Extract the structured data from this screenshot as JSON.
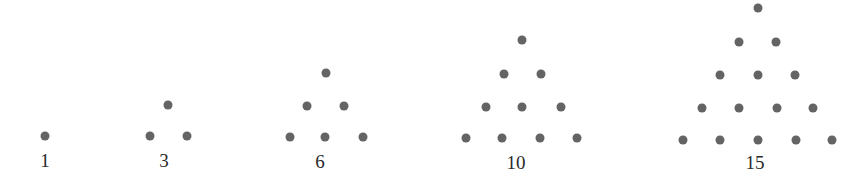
{
  "colors": {
    "dot": "#646464",
    "label": "#2a2a2a",
    "background": "#ffffff"
  },
  "figures": [
    {
      "label": "1",
      "label_pos": [
        45,
        160
      ],
      "dots": [
        [
          45,
          136
        ]
      ]
    },
    {
      "label": "3",
      "label_pos": [
        164,
        160
      ],
      "dots": [
        [
          168,
          105
        ],
        [
          150,
          136
        ],
        [
          187,
          136
        ]
      ]
    },
    {
      "label": "6",
      "label_pos": [
        320,
        161
      ],
      "dots": [
        [
          326,
          73
        ],
        [
          307,
          106
        ],
        [
          344,
          106
        ],
        [
          290,
          137
        ],
        [
          325,
          137
        ],
        [
          363,
          137
        ]
      ]
    },
    {
      "label": "10",
      "label_pos": [
        516,
        162
      ],
      "dots": [
        [
          522,
          40
        ],
        [
          504,
          74
        ],
        [
          541,
          74
        ],
        [
          486,
          107
        ],
        [
          522,
          107
        ],
        [
          561,
          107
        ],
        [
          466,
          138
        ],
        [
          502,
          138
        ],
        [
          540,
          138
        ],
        [
          577,
          138
        ]
      ]
    },
    {
      "label": "15",
      "label_pos": [
        755,
        162
      ],
      "dots": [
        [
          758,
          8
        ],
        [
          739,
          42
        ],
        [
          776,
          42
        ],
        [
          720,
          75
        ],
        [
          758,
          75
        ],
        [
          795,
          75
        ],
        [
          702,
          108
        ],
        [
          739,
          108
        ],
        [
          777,
          108
        ],
        [
          813,
          108
        ],
        [
          683,
          140
        ],
        [
          720,
          140
        ],
        [
          758,
          140
        ],
        [
          796,
          140
        ],
        [
          832,
          140
        ]
      ]
    }
  ]
}
